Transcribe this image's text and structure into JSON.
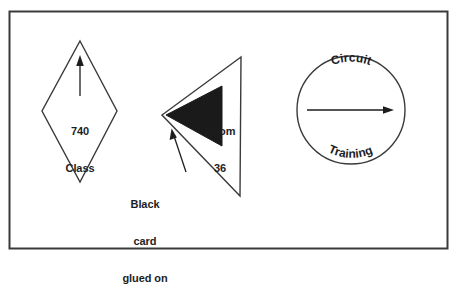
{
  "figure": {
    "background_color": "#ffffff",
    "line_color": "#3a3a3c",
    "fill_black": "#1a1a1a",
    "text_color": "#1d1d1f",
    "border": {
      "name": "figure-frame",
      "x": 9,
      "y": 11,
      "width": 439,
      "height": 238
    },
    "shapes": {
      "diamond": {
        "label_line1": "740",
        "label_line2": "Class",
        "arrow_direction": "up",
        "points": "80,41 117,111 80,182 42,111"
      },
      "triangle": {
        "label_line1": "Room",
        "label_line2": "36",
        "points": "241,57 162,115 240,196",
        "black_card": {
          "label": "black-card",
          "points": "166,115 222,85 222,146"
        }
      },
      "circle": {
        "top_text": "Circuit",
        "bottom_text": "Training",
        "arrow_direction": "right",
        "cx": 351,
        "cy": 110,
        "r": 54
      }
    },
    "annotation": {
      "line1": "Black",
      "line2": "card",
      "line3": "glued on",
      "leader_from": [
        186,
        172
      ],
      "leader_to": [
        172,
        131
      ]
    }
  }
}
